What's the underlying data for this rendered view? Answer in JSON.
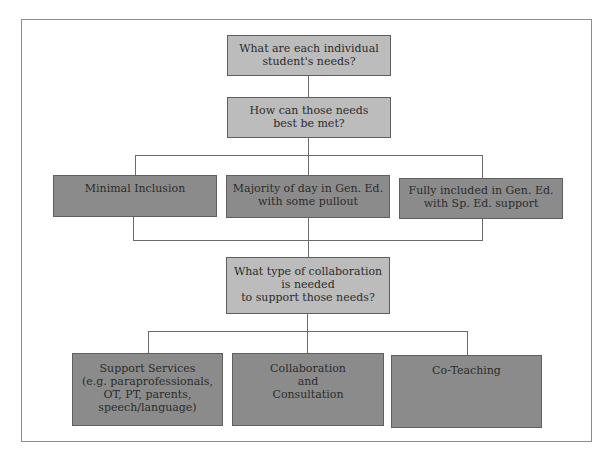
{
  "diagram": {
    "questions": [
      {
        "id": "q1",
        "lines": [
          "What are each individual",
          "student's needs?"
        ]
      },
      {
        "id": "q2",
        "lines": [
          "How can those needs",
          "best be met?"
        ]
      },
      {
        "id": "q3",
        "lines": [
          "What type of collaboration",
          "is needed",
          "to support those needs?"
        ]
      }
    ],
    "placement_options": [
      {
        "lines": [
          "Minimal Inclusion"
        ]
      },
      {
        "lines": [
          "Majority of day in Gen. Ed.",
          "with some pullout"
        ]
      },
      {
        "lines": [
          "Fully included in Gen. Ed.",
          "with Sp. Ed. support"
        ]
      }
    ],
    "collaboration_types": [
      {
        "lines": [
          "Support Services",
          "(e.g. paraprofessionals,",
          "OT, PT, parents,",
          "speech/language)"
        ]
      },
      {
        "lines": [
          "Collaboration",
          "and",
          "Consultation"
        ]
      },
      {
        "lines": [
          "Co-Teaching"
        ]
      }
    ],
    "colors": {
      "question_fill": "#bcbcbc",
      "option_fill": "#8b8b8b",
      "line": "#6a6a6a",
      "text": "#2b2b2b"
    }
  }
}
